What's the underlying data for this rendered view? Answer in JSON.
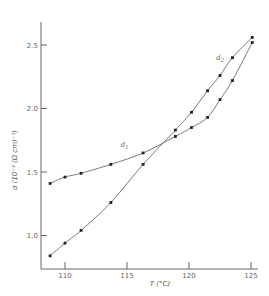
{
  "chart_data": {
    "type": "scatter",
    "title": "",
    "xlabel": "T (°C)",
    "ylabel": "σ (10⁻³ (Ω cm)⁻¹)",
    "xlim": [
      108,
      125.5
    ],
    "ylim": [
      0.76,
      2.65
    ],
    "xticks": [
      110,
      115,
      120,
      125
    ],
    "yticks": [
      1.0,
      1.5,
      2.0,
      2.5
    ],
    "xtick_labels": [
      "110",
      "115",
      "120",
      "125"
    ],
    "ytick_labels": [
      "1.0",
      "1.5",
      "2.0",
      "2.5"
    ],
    "grid": false,
    "legend": "inline curve labels",
    "series": [
      {
        "name": "d1",
        "label_sub": "1",
        "x": [
          108.8,
          110.0,
          111.3,
          113.7,
          116.3,
          118.9,
          120.2,
          121.5,
          122.5,
          123.5,
          125.1
        ],
        "y": [
          1.41,
          1.46,
          1.49,
          1.56,
          1.65,
          1.78,
          1.85,
          1.93,
          2.07,
          2.22,
          2.52
        ]
      },
      {
        "name": "d2",
        "label_sub": "2",
        "x": [
          108.8,
          110.0,
          111.3,
          113.7,
          116.3,
          118.9,
          120.2,
          121.5,
          122.5,
          123.5,
          125.1
        ],
        "y": [
          0.84,
          0.94,
          1.04,
          1.26,
          1.56,
          1.83,
          1.97,
          2.14,
          2.26,
          2.4,
          2.56
        ]
      }
    ],
    "annotations": [
      {
        "text": "d",
        "sub": "1",
        "x": 114.5,
        "y": 1.7
      },
      {
        "text": "d",
        "sub": "2",
        "x": 122.2,
        "y": 2.38
      }
    ],
    "colors": {
      "line": "#555555",
      "marker": "#222222",
      "axis": "#666666"
    }
  }
}
